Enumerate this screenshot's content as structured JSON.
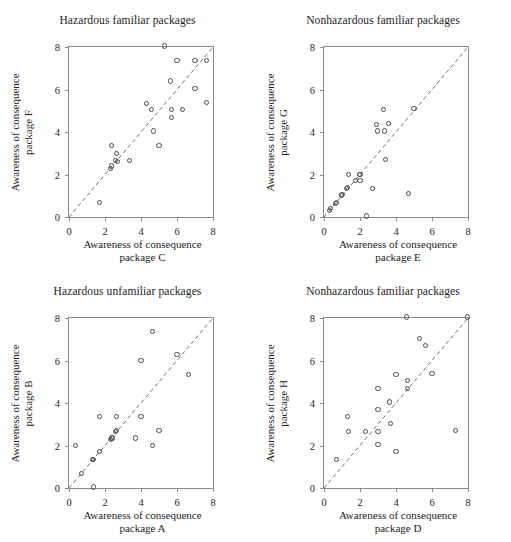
{
  "figure": {
    "layout": "2x2 grid of scatter plots",
    "marker_style": "open-circle",
    "marker_color": "#4a4a4a",
    "axis_color": "#8a8a8a",
    "background": "#ffffff",
    "reference_line": "dashed 1:1 identity line"
  },
  "chart_data": [
    {
      "type": "scatter",
      "panel": "top-left",
      "title": "Hazardous familiar packages",
      "xlabel_line1": "Awareness of consequence",
      "xlabel_line2": "package C",
      "ylabel_line1": "Awareness of consequence",
      "ylabel_line2": "package F",
      "xlim": [
        0,
        8
      ],
      "ylim": [
        0,
        8
      ],
      "xticks": [
        0,
        2,
        4,
        6,
        8
      ],
      "yticks": [
        0,
        2,
        4,
        6,
        8
      ],
      "grid": false,
      "legend": "none",
      "annotations": [
        "dashed 1:1 reference line from (0,0) to (8,8)"
      ],
      "points": [
        [
          1.7,
          0.7
        ],
        [
          2.3,
          2.3
        ],
        [
          2.35,
          2.4
        ],
        [
          2.35,
          3.35
        ],
        [
          2.6,
          2.65
        ],
        [
          2.65,
          3.0
        ],
        [
          2.7,
          2.6
        ],
        [
          3.35,
          2.65
        ],
        [
          4.3,
          5.35
        ],
        [
          4.6,
          5.05
        ],
        [
          4.7,
          4.05
        ],
        [
          5.0,
          3.35
        ],
        [
          5.3,
          8.05
        ],
        [
          5.65,
          6.4
        ],
        [
          5.7,
          5.05
        ],
        [
          5.7,
          4.7
        ],
        [
          6.0,
          7.35
        ],
        [
          6.3,
          5.05
        ],
        [
          7.0,
          7.35
        ],
        [
          7.0,
          6.05
        ],
        [
          7.65,
          7.35
        ],
        [
          7.65,
          5.4
        ]
      ]
    },
    {
      "type": "scatter",
      "panel": "top-right",
      "title": "Nonhazardous familiar packages",
      "xlabel_line1": "Awareness of consequence",
      "xlabel_line2": "package E",
      "ylabel_line1": "Awareness of consequence",
      "ylabel_line2": "package G",
      "xlim": [
        0,
        8
      ],
      "ylim": [
        0,
        8
      ],
      "xticks": [
        0,
        2,
        4,
        6,
        8
      ],
      "yticks": [
        0,
        2,
        4,
        6,
        8
      ],
      "grid": false,
      "legend": "none",
      "annotations": [
        "dashed 1:1 reference line from (0,0) to (8,8)"
      ],
      "points": [
        [
          0.3,
          0.3
        ],
        [
          0.35,
          0.4
        ],
        [
          0.65,
          0.65
        ],
        [
          0.7,
          0.7
        ],
        [
          0.95,
          1.0
        ],
        [
          1.0,
          1.05
        ],
        [
          1.25,
          1.35
        ],
        [
          1.3,
          1.4
        ],
        [
          1.35,
          2.0
        ],
        [
          1.75,
          1.7
        ],
        [
          1.95,
          2.0
        ],
        [
          2.0,
          2.0
        ],
        [
          2.0,
          1.7
        ],
        [
          2.35,
          0.05
        ],
        [
          2.7,
          1.35
        ],
        [
          2.9,
          4.35
        ],
        [
          2.95,
          4.05
        ],
        [
          3.3,
          5.05
        ],
        [
          3.35,
          4.05
        ],
        [
          3.6,
          4.4
        ],
        [
          3.4,
          2.7
        ],
        [
          4.7,
          1.1
        ],
        [
          5.0,
          5.1
        ]
      ]
    },
    {
      "type": "scatter",
      "panel": "bottom-left",
      "title": "Hazardous unfamiliar packages",
      "xlabel_line1": "Awareness of consequence",
      "xlabel_line2": "package A",
      "ylabel_line1": "Awareness of consequence",
      "ylabel_line2": "package B",
      "xlim": [
        0,
        8
      ],
      "ylim": [
        0,
        8
      ],
      "xticks": [
        0,
        2,
        4,
        6,
        8
      ],
      "yticks": [
        0,
        2,
        4,
        6,
        8
      ],
      "grid": false,
      "legend": "none",
      "annotations": [
        "dashed 1:1 reference line from (0,0) to (8,8)"
      ],
      "points": [
        [
          0.35,
          2.0
        ],
        [
          0.7,
          0.7
        ],
        [
          1.3,
          1.35
        ],
        [
          1.35,
          1.35
        ],
        [
          1.35,
          0.05
        ],
        [
          1.7,
          1.7
        ],
        [
          1.7,
          3.35
        ],
        [
          2.3,
          2.3
        ],
        [
          2.35,
          2.35
        ],
        [
          2.4,
          2.35
        ],
        [
          2.6,
          2.65
        ],
        [
          2.65,
          2.7
        ],
        [
          2.65,
          3.35
        ],
        [
          3.7,
          2.35
        ],
        [
          4.0,
          6.0
        ],
        [
          4.0,
          3.35
        ],
        [
          4.65,
          7.35
        ],
        [
          4.65,
          2.0
        ],
        [
          5.0,
          2.7
        ],
        [
          6.0,
          6.3
        ],
        [
          6.65,
          5.35
        ]
      ]
    },
    {
      "type": "scatter",
      "panel": "bottom-right",
      "title": "Nonhazardous familiar packages",
      "xlabel_line1": "Awareness of consequence",
      "xlabel_line2": "package D",
      "ylabel_line1": "Awareness of consequence",
      "ylabel_line2": "package H",
      "xlim": [
        0,
        8
      ],
      "ylim": [
        0,
        8
      ],
      "xticks": [
        0,
        2,
        4,
        6,
        8
      ],
      "yticks": [
        0,
        2,
        4,
        6,
        8
      ],
      "grid": false,
      "legend": "none",
      "annotations": [
        "dashed 1:1 reference line from (0,0) to (8,8)"
      ],
      "points": [
        [
          0.7,
          1.35
        ],
        [
          1.3,
          3.35
        ],
        [
          1.35,
          2.65
        ],
        [
          2.3,
          2.65
        ],
        [
          3.0,
          4.7
        ],
        [
          3.0,
          3.7
        ],
        [
          3.0,
          2.65
        ],
        [
          3.0,
          2.05
        ],
        [
          3.65,
          4.05
        ],
        [
          3.7,
          3.05
        ],
        [
          4.0,
          5.35
        ],
        [
          4.0,
          1.7
        ],
        [
          4.6,
          8.05
        ],
        [
          4.65,
          5.05
        ],
        [
          4.65,
          4.7
        ],
        [
          5.3,
          7.05
        ],
        [
          5.65,
          6.7
        ],
        [
          6.0,
          5.4
        ],
        [
          7.3,
          2.7
        ],
        [
          7.95,
          8.05
        ]
      ]
    }
  ]
}
